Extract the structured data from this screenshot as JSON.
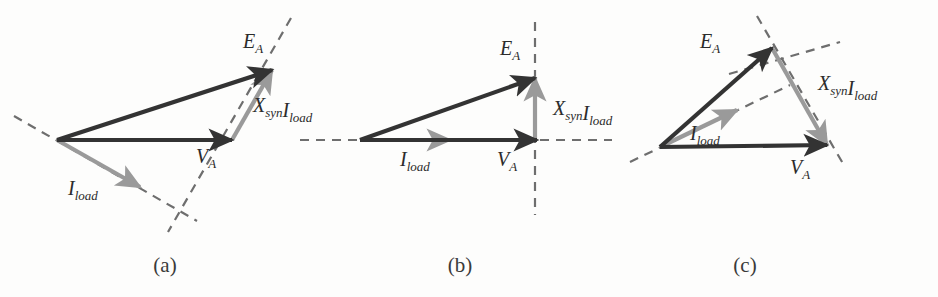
{
  "figure": {
    "colors": {
      "dark_vector": "#333333",
      "gray_vector": "#9a9a9a",
      "dashed_reference": "#6e6e6e",
      "background": "#fdfdfc",
      "label_text": "#2b2b2b"
    },
    "labels": {
      "EA": {
        "base": "E",
        "sub": "A"
      },
      "VA": {
        "base": "V",
        "sub": "A"
      },
      "Iload": {
        "base": "I",
        "sub": "load"
      },
      "XsynIload": {
        "base1": "X",
        "sub1": "syn",
        "base2": "I",
        "sub2": "load"
      }
    },
    "panels": [
      {
        "id": "a",
        "caption": "(a)",
        "caption_x": 165,
        "caption_y": 272,
        "power_factor": "lagging",
        "origin": {
          "x": 57,
          "y": 140
        },
        "vectors": [
          {
            "name": "EA",
            "style": "dark",
            "from": {
              "x": 57,
              "y": 140
            },
            "to": {
              "x": 272,
              "y": 70
            },
            "label_x": 243,
            "label_y": 48
          },
          {
            "name": "VA",
            "style": "dark",
            "from": {
              "x": 57,
              "y": 140
            },
            "to": {
              "x": 232,
              "y": 140
            },
            "label_x": 196,
            "label_y": 163
          },
          {
            "name": "XsynIload",
            "style": "gray",
            "from": {
              "x": 232,
              "y": 140
            },
            "to": {
              "x": 272,
              "y": 70
            },
            "label_x": 253,
            "label_y": 112
          },
          {
            "name": "Iload",
            "style": "gray",
            "from": {
              "x": 57,
              "y": 140
            },
            "to": {
              "x": 140,
              "y": 187
            },
            "label_x": 68,
            "label_y": 195
          }
        ],
        "dashed_lines": [
          {
            "from": {
              "x": 14,
              "y": 116
            },
            "to": {
              "x": 197,
              "y": 221
            }
          },
          {
            "from": {
              "x": 291,
              "y": 18
            },
            "to": {
              "x": 168,
              "y": 232
            }
          }
        ]
      },
      {
        "id": "b",
        "caption": "(b)",
        "caption_x": 460,
        "caption_y": 272,
        "power_factor": "unity",
        "origin": {
          "x": 360,
          "y": 140
        },
        "vectors": [
          {
            "name": "EA",
            "style": "dark",
            "from": {
              "x": 360,
              "y": 140
            },
            "to": {
              "x": 535,
              "y": 78
            },
            "label_x": 500,
            "label_y": 55
          },
          {
            "name": "VA",
            "style": "dark",
            "from": {
              "x": 360,
              "y": 140
            },
            "to": {
              "x": 537,
              "y": 140
            },
            "label_x": 497,
            "label_y": 166
          },
          {
            "name": "XsynIload",
            "style": "gray",
            "from": {
              "x": 535,
              "y": 140
            },
            "to": {
              "x": 535,
              "y": 78
            },
            "label_x": 553,
            "label_y": 115
          },
          {
            "name": "Iload",
            "style": "gray",
            "from": {
              "x": 360,
              "y": 140
            },
            "to": {
              "x": 450,
              "y": 140
            },
            "label_x": 400,
            "label_y": 166
          }
        ],
        "dashed_lines": [
          {
            "from": {
              "x": 300,
              "y": 140
            },
            "to": {
              "x": 612,
              "y": 140
            }
          },
          {
            "from": {
              "x": 535,
              "y": 22
            },
            "to": {
              "x": 535,
              "y": 215
            }
          }
        ]
      },
      {
        "id": "c",
        "caption": "(c)",
        "caption_x": 745,
        "caption_y": 272,
        "power_factor": "leading",
        "origin": {
          "x": 660,
          "y": 147
        },
        "vectors": [
          {
            "name": "EA",
            "style": "dark",
            "from": {
              "x": 660,
              "y": 147
            },
            "to": {
              "x": 772,
              "y": 48
            },
            "label_x": 700,
            "label_y": 48
          },
          {
            "name": "VA",
            "style": "dark",
            "from": {
              "x": 660,
              "y": 147
            },
            "to": {
              "x": 827,
              "y": 145
            },
            "label_x": 790,
            "label_y": 174
          },
          {
            "name": "XsynIload",
            "style": "gray",
            "from": {
              "x": 772,
              "y": 48
            },
            "to": {
              "x": 827,
              "y": 145
            },
            "label_x": 818,
            "label_y": 90
          },
          {
            "name": "Iload",
            "style": "gray",
            "from": {
              "x": 660,
              "y": 147
            },
            "to": {
              "x": 737,
              "y": 110
            },
            "label_x": 690,
            "label_y": 140
          }
        ],
        "dashed_lines": [
          {
            "from": {
              "x": 630,
              "y": 162
            },
            "to": {
              "x": 790,
              "y": 85
            }
          },
          {
            "from": {
              "x": 757,
              "y": 16
            },
            "to": {
              "x": 845,
              "y": 167
            }
          },
          {
            "from": {
              "x": 729,
              "y": 74
            },
            "to": {
              "x": 840,
              "y": 42
            }
          }
        ]
      }
    ]
  }
}
